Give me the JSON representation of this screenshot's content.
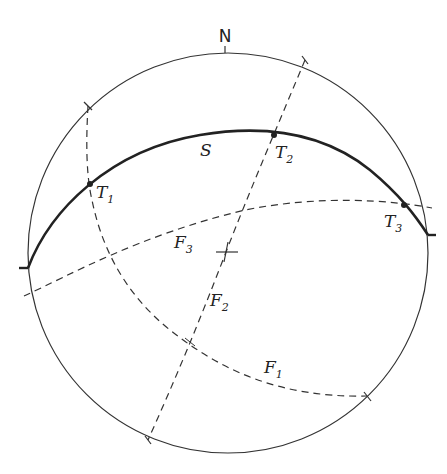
{
  "diagram": {
    "type": "stereonet",
    "north_label": "N",
    "primitive_circle": {
      "cx": 228,
      "cy": 253,
      "r": 200
    },
    "great_circles": [
      {
        "id": "S",
        "label": "S",
        "subscript": "",
        "style": "solid-bold"
      },
      {
        "id": "F1",
        "label": "F",
        "subscript": "1",
        "style": "dashed"
      },
      {
        "id": "F2",
        "label": "F",
        "subscript": "2",
        "style": "dashed"
      },
      {
        "id": "F3",
        "label": "F",
        "subscript": "3",
        "style": "dashed"
      }
    ],
    "points": [
      {
        "id": "T1",
        "label": "T",
        "subscript": "1"
      },
      {
        "id": "T2",
        "label": "T",
        "subscript": "2"
      },
      {
        "id": "T3",
        "label": "T",
        "subscript": "3"
      }
    ],
    "center_mark": "cross",
    "colors": {
      "line": "#222222",
      "background": "#ffffff"
    }
  }
}
